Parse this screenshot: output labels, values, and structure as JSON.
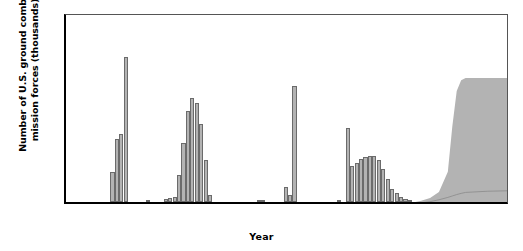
{
  "chart_data": {
    "type": "bar",
    "title": "",
    "xlabel": "Year",
    "ylabel": "Number of U.S. ground combat mission forces (thousands)",
    "xlim": [
      1940,
      2040
    ],
    "ylim": [
      0,
      800
    ],
    "yticks": [
      0,
      200,
      400,
      600,
      800
    ],
    "xticks": [
      1940,
      1960,
      1980,
      2000,
      2020,
      2040
    ],
    "grid": false,
    "legend": "none",
    "bar_color": "#b3b3b3",
    "bar_edge_color": "#6b6b6b",
    "band_color": "#b3b3b3",
    "categories": [
      1950,
      1951,
      1952,
      1953,
      1958,
      1962,
      1963,
      1964,
      1965,
      1966,
      1967,
      1968,
      1969,
      1970,
      1971,
      1972,
      1983,
      1984,
      1989,
      1990,
      1991,
      2001,
      2003,
      2004,
      2005,
      2006,
      2007,
      2008,
      2009,
      2010,
      2011,
      2012,
      2013,
      2014,
      2015,
      2016,
      2017
    ],
    "values": [
      125,
      265,
      285,
      610,
      9,
      14,
      17,
      23,
      115,
      250,
      385,
      440,
      415,
      330,
      175,
      30,
      8,
      10,
      65,
      30,
      490,
      7,
      310,
      150,
      165,
      180,
      190,
      195,
      195,
      175,
      140,
      95,
      55,
      40,
      22,
      12,
      8
    ],
    "annotations": [
      {
        "label": "Korean War peak",
        "x": 1953,
        "y": 610
      },
      {
        "label": "Vietnam War peak",
        "x": 1968,
        "y": 440
      },
      {
        "label": "Gulf War peak",
        "x": 1991,
        "y": 490
      },
      {
        "label": "Iraq War surge",
        "x": 2003,
        "y": 310
      }
    ],
    "forecast": {
      "description": "Projected uncertainty band rising sharply after 2027 to a plateau",
      "x": [
        2016,
        2018,
        2020,
        2022,
        2024,
        2026,
        2027,
        2028,
        2029,
        2030,
        2035,
        2040
      ],
      "upper": [
        6,
        10,
        18,
        30,
        55,
        140,
        330,
        480,
        525,
        535,
        535,
        535
      ],
      "lower": [
        0,
        0,
        0,
        0,
        0,
        0,
        0,
        0,
        0,
        0,
        0,
        0
      ],
      "median": [
        4,
        6,
        9,
        14,
        22,
        32,
        38,
        44,
        49,
        53,
        58,
        60
      ]
    }
  }
}
